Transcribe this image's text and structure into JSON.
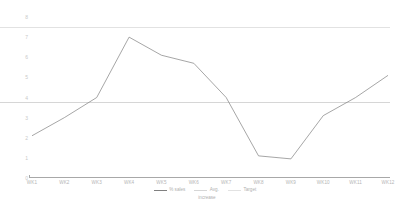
{
  "chart_data": {
    "type": "line",
    "title": "",
    "xlabel": "",
    "ylabel": "",
    "categories": [
      "WK1",
      "WK2",
      "WK3",
      "WK4",
      "WK5",
      "WK6",
      "WK7",
      "WK8",
      "WK9",
      "WK10",
      "WK11",
      "WK12"
    ],
    "ylim": [
      0,
      8
    ],
    "yticks": [
      8,
      7,
      6,
      5,
      4,
      3,
      2,
      1,
      0
    ],
    "grid": false,
    "legend_position": "bottom",
    "series": [
      {
        "name": "% sales increase",
        "type": "line",
        "color": "#808080",
        "values": [
          2.1,
          3.0,
          4.0,
          7.0,
          6.1,
          5.7,
          4.0,
          1.1,
          0.95,
          3.1,
          4.0,
          5.1
        ]
      },
      {
        "name": "Avg.",
        "type": "constant-line",
        "color": "#d6d6d6",
        "value": 3.8
      },
      {
        "name": "Target",
        "type": "constant-line",
        "color": "#e2e2e2",
        "value": 7.5
      }
    ]
  },
  "legend": {
    "items": [
      {
        "label": "% sales",
        "color": "#808080"
      },
      {
        "label": "Avg.",
        "color": "#d6d6d6"
      },
      {
        "label": "Target",
        "color": "#e2e2e2"
      }
    ],
    "wrapped_label": "increase"
  }
}
